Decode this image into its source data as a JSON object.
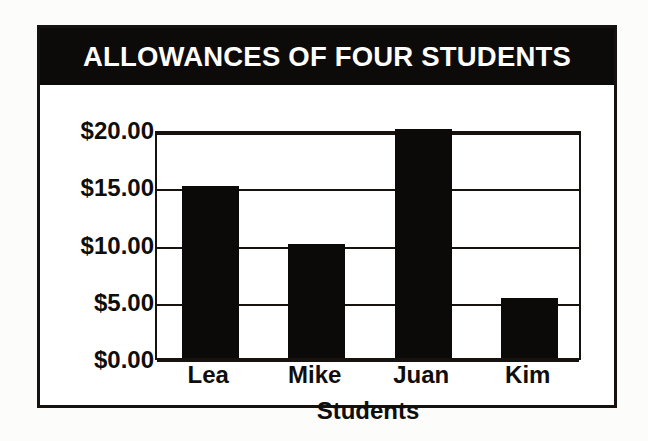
{
  "chart_data": {
    "type": "bar",
    "title": "ALLOWANCES OF FOUR STUDENTS",
    "categories": [
      "Lea",
      "Mike",
      "Juan",
      "Kim"
    ],
    "values": [
      15.0,
      10.0,
      20.0,
      5.2
    ],
    "xlabel": "Students",
    "ylabel": "",
    "ylim": [
      0,
      20
    ],
    "ytick_values": [
      20,
      15,
      10,
      5,
      0
    ],
    "ytick_labels": [
      "$20.00",
      "$15.00",
      "$10.00",
      "$5.00",
      "$0.00"
    ],
    "grid": true,
    "legend": false,
    "bar_color": "#0b0a08",
    "title_background": "#0d0b09",
    "title_color": "#ffffff",
    "axis_color": "#15120f",
    "plot_background": "#ffffff"
  }
}
